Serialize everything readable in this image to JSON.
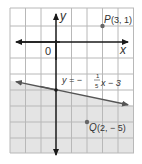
{
  "graph": {
    "x_axis_label": "x",
    "y_axis_label": "y",
    "origin_label": "0",
    "x_range": [
      -3,
      5
    ],
    "y_range": [
      -7,
      2
    ],
    "line": {
      "equation_lhs": "y = −",
      "fraction_num": "1",
      "fraction_den": "5",
      "equation_rhs": "x − 3",
      "slope": -0.2,
      "intercept": -3,
      "shaded_region": "below"
    },
    "points": [
      {
        "name": "P",
        "coords": "(3, 1)",
        "x": 3,
        "y": 1
      },
      {
        "name": "Q",
        "coords": "(2, − 5)",
        "x": 2,
        "y": -5
      }
    ],
    "colors": {
      "grid": "#b8b8b8",
      "shade": "#e4e4e4",
      "axis": "#1a1a1a",
      "line": "#555555",
      "point": "#666666"
    }
  }
}
